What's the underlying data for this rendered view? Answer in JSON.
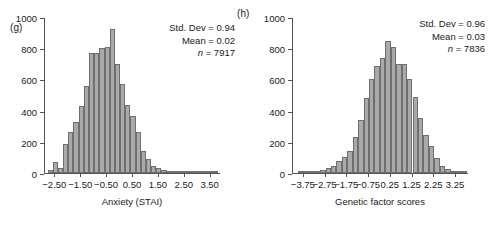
{
  "figure": {
    "panels": [
      {
        "id": "g",
        "label": "(g)",
        "xlabel": "Anxiety (STAI)",
        "stats": {
          "std_dev_label": "Std. Dev = 0.94",
          "mean_label": "Mean = 0.02",
          "n_symbol": "n",
          "n_label": " = 7917"
        }
      },
      {
        "id": "h",
        "label": "(h)",
        "xlabel": "Genetic factor scores",
        "stats": {
          "std_dev_label": "Std. Dev = 0.96",
          "mean_label": "Mean = 0.03",
          "n_symbol": "n",
          "n_label": " = 7836"
        }
      }
    ]
  },
  "chart_data": [
    {
      "type": "bar",
      "panel": "(g)",
      "title": "",
      "xlabel": "Anxiety (STAI)",
      "ylabel": "",
      "ylim": [
        0,
        1000
      ],
      "yticks": [
        0,
        200,
        400,
        600,
        800,
        1000
      ],
      "ytick_labels": [
        "0",
        "200",
        "400",
        "600",
        "800",
        "1000"
      ],
      "xlim": [
        -2.9,
        3.9
      ],
      "xticks": [
        -2.5,
        -1.5,
        -0.5,
        0.5,
        1.5,
        2.5,
        3.5
      ],
      "xtick_labels": [
        "−2.50",
        "−1.50",
        "−0.50",
        "0.50",
        "1.50",
        "2.50",
        "3.50"
      ],
      "grid": false,
      "legend": "none",
      "annotations": [
        "Std. Dev = 0.94",
        "Mean = 0.02",
        "n = 7917"
      ],
      "statistics": {
        "std_dev": 0.94,
        "mean": 0.02,
        "n": 7917
      },
      "bin_width": 0.2,
      "bin_centers": [
        -2.7,
        -2.5,
        -2.3,
        -2.1,
        -1.9,
        -1.7,
        -1.5,
        -1.3,
        -1.1,
        -0.9,
        -0.7,
        -0.5,
        -0.3,
        -0.1,
        0.1,
        0.3,
        0.5,
        0.7,
        0.9,
        1.1,
        1.3,
        1.5,
        1.7,
        1.9,
        2.1,
        2.3,
        2.5,
        2.7,
        2.9,
        3.1,
        3.3,
        3.5,
        3.7
      ],
      "values": [
        20,
        70,
        30,
        185,
        265,
        330,
        430,
        560,
        770,
        770,
        800,
        805,
        925,
        700,
        570,
        435,
        365,
        260,
        140,
        90,
        45,
        35,
        20,
        12,
        8,
        5,
        4,
        3,
        2,
        2,
        1,
        1,
        1
      ]
    },
    {
      "type": "bar",
      "panel": "(h)",
      "title": "",
      "xlabel": "Genetic factor scores",
      "ylabel": "",
      "ylim": [
        0,
        1000
      ],
      "yticks": [
        0,
        200,
        400,
        600,
        800,
        1000
      ],
      "ytick_labels": [
        "0",
        "200",
        "400",
        "600",
        "800",
        "1000"
      ],
      "xlim": [
        -4.25,
        3.85
      ],
      "xticks": [
        -3.75,
        -2.75,
        -1.75,
        -0.75,
        0.25,
        1.25,
        2.25,
        3.25
      ],
      "xtick_labels": [
        "−3.75",
        "−2.75",
        "−1.75",
        "−0.75",
        "0.25",
        "1.25",
        "2.25",
        "3.25"
      ],
      "grid": false,
      "legend": "none",
      "annotations": [
        "Std. Dev = 0.96",
        "Mean = 0.03",
        "n = 7836"
      ],
      "statistics": {
        "std_dev": 0.96,
        "mean": 0.03,
        "n": 7836
      },
      "bin_width": 0.25,
      "bin_centers": [
        -3.875,
        -3.625,
        -3.375,
        -3.125,
        -2.875,
        -2.625,
        -2.375,
        -2.125,
        -1.875,
        -1.625,
        -1.375,
        -1.125,
        -0.875,
        -0.625,
        -0.375,
        -0.125,
        0.125,
        0.375,
        0.625,
        0.875,
        1.125,
        1.375,
        1.625,
        1.875,
        2.125,
        2.375,
        2.625,
        2.875,
        3.125,
        3.375,
        3.625
      ],
      "values": [
        3,
        5,
        8,
        12,
        22,
        35,
        48,
        75,
        100,
        140,
        230,
        340,
        480,
        600,
        685,
        740,
        845,
        810,
        700,
        700,
        600,
        490,
        350,
        245,
        170,
        95,
        48,
        28,
        12,
        6,
        3
      ]
    }
  ]
}
